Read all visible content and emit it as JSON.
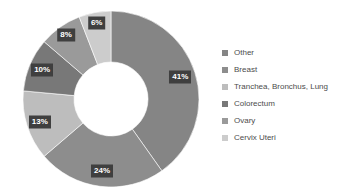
{
  "chart_data": {
    "type": "pie",
    "variant": "donut",
    "title": "",
    "subtitle": "",
    "xlabel": "",
    "ylabel": "",
    "units": "percent",
    "grid": false,
    "legend_position": "right",
    "start_angle_deg": 0,
    "direction": "clockwise",
    "inner_radius_ratio": 0.42,
    "categories": [
      "Other",
      "Breast",
      "Tranchea, Bronchus, Lung",
      "Colorectum",
      "Ovary",
      "Cervix Uteri"
    ],
    "values": [
      41,
      24,
      13,
      10,
      8,
      6
    ],
    "data_labels": [
      "41%",
      "24%",
      "13%",
      "10%",
      "8%",
      "6%"
    ],
    "colors": [
      "#858585",
      "#8d8d8d",
      "#bdbdbd",
      "#787878",
      "#9a9a9a",
      "#cccccc"
    ],
    "slices": [
      {
        "label": "Other",
        "value": 41,
        "data_label": "41%",
        "color": "#858585"
      },
      {
        "label": "Breast",
        "value": 24,
        "data_label": "24%",
        "color": "#8d8d8d"
      },
      {
        "label": "Tranchea, Bronchus, Lung",
        "value": 13,
        "data_label": "13%",
        "color": "#bdbdbd"
      },
      {
        "label": "Colorectum",
        "value": 10,
        "data_label": "10%",
        "color": "#787878"
      },
      {
        "label": "Ovary",
        "value": 8,
        "data_label": "8%",
        "color": "#9a9a9a"
      },
      {
        "label": "Cervix Uteri",
        "value": 6,
        "data_label": "6%",
        "color": "#cccccc"
      }
    ]
  },
  "legend": {
    "items": [
      {
        "label": "Other",
        "color": "#858585"
      },
      {
        "label": "Breast",
        "color": "#8d8d8d"
      },
      {
        "label": "Tranchea, Bronchus, Lung",
        "color": "#bdbdbd"
      },
      {
        "label": "Colorectum",
        "color": "#787878"
      },
      {
        "label": "Ovary",
        "color": "#9a9a9a"
      },
      {
        "label": "Cervix Uteri",
        "color": "#cccccc"
      }
    ]
  },
  "style": {
    "background": "#ffffff",
    "label_badge_bg": "#3f3f3f",
    "label_badge_text": "#ffffff",
    "legend_text_color": "#4c4c4c",
    "hole_color": "#ffffff"
  },
  "geometry": {
    "center_x": 111,
    "center_y": 99,
    "outer_radius": 88,
    "inner_radius": 37
  }
}
